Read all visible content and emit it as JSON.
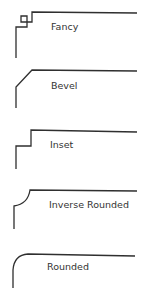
{
  "colors": {
    "stroke": "#2f2f2f",
    "text": "#333333",
    "background": "#ffffff"
  },
  "corner_styles": [
    {
      "name": "fancy",
      "label": "Fancy"
    },
    {
      "name": "bevel",
      "label": "Bevel"
    },
    {
      "name": "inset",
      "label": "Inset"
    },
    {
      "name": "inverse-rounded",
      "label": "Inverse Rounded"
    },
    {
      "name": "rounded",
      "label": "Rounded"
    }
  ]
}
